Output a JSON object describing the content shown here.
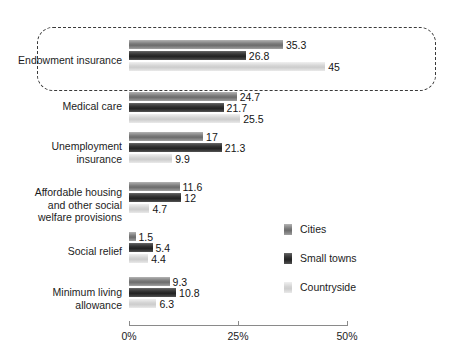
{
  "chart_data": {
    "type": "bar",
    "orientation": "horizontal",
    "title": "",
    "xlabel": "",
    "ylabel": "",
    "xlim": [
      0,
      50
    ],
    "xticks": [
      "0%",
      "25%",
      "50%"
    ],
    "xtick_values": [
      0,
      25,
      50
    ],
    "grid": false,
    "legend_position": "right-middle",
    "categories": [
      "Endowment insurance",
      "Medical care",
      "Unemployment insurance",
      "Affordable housing and other social welfare provisions",
      "Social relief",
      "Minimum living allowance"
    ],
    "series": [
      {
        "name": "Cities",
        "color": "#767676",
        "values": [
          35.3,
          24.7,
          17,
          11.6,
          1.5,
          9.3
        ]
      },
      {
        "name": "Small towns",
        "color": "#2c2c2c",
        "values": [
          26.8,
          21.7,
          21.3,
          12,
          5.4,
          10.8
        ]
      },
      {
        "name": "Countryside",
        "color": "#d2d2d2",
        "values": [
          45,
          25.5,
          9.9,
          4.7,
          4.4,
          6.3
        ]
      }
    ],
    "annotations": [
      {
        "type": "dashed-rounded-box",
        "target_category": "Endowment insurance",
        "note": "Dashed rounded rectangle highlighting the Endowment insurance group"
      }
    ]
  },
  "groups": [
    {
      "label_lines": [
        "Endowment insurance"
      ],
      "bars": [
        {
          "series": "Cities",
          "value": 35.3,
          "value_label": "35.3"
        },
        {
          "series": "Small towns",
          "value": 26.8,
          "value_label": "26.8"
        },
        {
          "series": "Countryside",
          "value": 45,
          "value_label": "45"
        }
      ]
    },
    {
      "label_lines": [
        "Medical care"
      ],
      "bars": [
        {
          "series": "Cities",
          "value": 24.7,
          "value_label": "24.7"
        },
        {
          "series": "Small towns",
          "value": 21.7,
          "value_label": "21.7"
        },
        {
          "series": "Countryside",
          "value": 25.5,
          "value_label": "25.5"
        }
      ]
    },
    {
      "label_lines": [
        "Unemployment",
        "insurance"
      ],
      "bars": [
        {
          "series": "Cities",
          "value": 17,
          "value_label": "17"
        },
        {
          "series": "Small towns",
          "value": 21.3,
          "value_label": "21.3"
        },
        {
          "series": "Countryside",
          "value": 9.9,
          "value_label": "9.9"
        }
      ]
    },
    {
      "label_lines": [
        "Affordable housing",
        "and other social",
        "welfare provisions"
      ],
      "bars": [
        {
          "series": "Cities",
          "value": 11.6,
          "value_label": "11.6"
        },
        {
          "series": "Small towns",
          "value": 12,
          "value_label": "12"
        },
        {
          "series": "Countryside",
          "value": 4.7,
          "value_label": "4.7"
        }
      ]
    },
    {
      "label_lines": [
        "Social relief"
      ],
      "bars": [
        {
          "series": "Cities",
          "value": 1.5,
          "value_label": "1.5"
        },
        {
          "series": "Small towns",
          "value": 5.4,
          "value_label": "5.4"
        },
        {
          "series": "Countryside",
          "value": 4.4,
          "value_label": "4.4"
        }
      ]
    },
    {
      "label_lines": [
        "Minimum living",
        "allowance"
      ],
      "bars": [
        {
          "series": "Cities",
          "value": 9.3,
          "value_label": "9.3"
        },
        {
          "series": "Small towns",
          "value": 10.8,
          "value_label": "10.8"
        },
        {
          "series": "Countryside",
          "value": 6.3,
          "value_label": "6.3"
        }
      ]
    }
  ],
  "legend": {
    "items": [
      {
        "label": "Cities",
        "key": "cities"
      },
      {
        "label": "Small towns",
        "key": "small-towns"
      },
      {
        "label": "Countryside",
        "key": "countryside"
      }
    ]
  },
  "axis": {
    "ticks": [
      {
        "label": "0%",
        "value": 0
      },
      {
        "label": "25%",
        "value": 25
      },
      {
        "label": "50%",
        "value": 50
      }
    ]
  }
}
